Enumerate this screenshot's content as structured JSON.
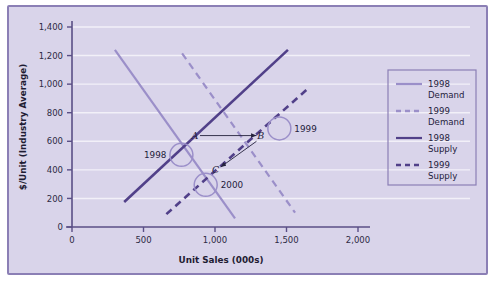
{
  "chart_data": {
    "type": "line",
    "title": "",
    "xlabel": "Unit Sales (000s)",
    "ylabel": "$/Unit (Industry Average)",
    "xlim": [
      0,
      2000
    ],
    "ylim": [
      0,
      1400
    ],
    "xticks": [
      "0",
      "500",
      "1,000",
      "1,500",
      "2,000"
    ],
    "xtick_values": [
      0,
      500,
      1000,
      1500,
      2000
    ],
    "yticks": [
      "0",
      "200",
      "400",
      "600",
      "800",
      "1,000",
      "1,200",
      "1,400"
    ],
    "ytick_values": [
      0,
      200,
      400,
      600,
      800,
      1000,
      1200,
      1400
    ],
    "grid": true,
    "grid_color": "#f2f0f8",
    "legend_position": "right",
    "series": [
      {
        "name": "1998 Demand",
        "style": "solid",
        "color": "#9b8fc9",
        "width": 2.2,
        "points": [
          [
            300,
            1240
          ],
          [
            1140,
            60
          ]
        ]
      },
      {
        "name": "1999 Demand",
        "style": "dashed",
        "color": "#9b8fc9",
        "width": 2.2,
        "points": [
          [
            770,
            1215
          ],
          [
            1560,
            100
          ]
        ]
      },
      {
        "name": "1998 Supply",
        "style": "solid",
        "color": "#514089",
        "width": 2.6,
        "points": [
          [
            365,
            175
          ],
          [
            1510,
            1240
          ]
        ]
      },
      {
        "name": "1999 Supply",
        "style": "dashed",
        "color": "#514089",
        "width": 2.6,
        "points": [
          [
            660,
            90
          ],
          [
            1640,
            960
          ]
        ]
      }
    ],
    "markers": [
      {
        "label": "1998",
        "x": 765,
        "y": 505,
        "label_side": "left"
      },
      {
        "label": "1999",
        "x": 1450,
        "y": 690,
        "label_side": "right"
      },
      {
        "label": "2000",
        "x": 935,
        "y": 295,
        "label_side": "right"
      }
    ],
    "annotations": [
      {
        "label": "A",
        "x": 860,
        "y": 640
      },
      {
        "label": "B",
        "x": 1320,
        "y": 640
      },
      {
        "label": "C",
        "x": 1005,
        "y": 400
      }
    ],
    "arrows": [
      {
        "from": [
          895,
          640
        ],
        "to": [
          1290,
          640
        ],
        "name": "a-to-b-arrow"
      },
      {
        "from": [
          1290,
          600
        ],
        "to": [
          1040,
          420
        ],
        "name": "b-to-c-arrow"
      }
    ]
  },
  "legend": {
    "items": [
      {
        "label_line1": "1998",
        "label_line2": "Demand",
        "style": "solid",
        "color": "#9b8fc9"
      },
      {
        "label_line1": "1999",
        "label_line2": "Demand",
        "style": "dashed",
        "color": "#9b8fc9"
      },
      {
        "label_line1": "1998",
        "label_line2": "Supply",
        "style": "solid",
        "color": "#514089"
      },
      {
        "label_line1": "1999",
        "label_line2": "Supply",
        "style": "dashed",
        "color": "#514089"
      }
    ]
  },
  "colors": {
    "panel_background": "#d9d4ea",
    "frame_border": "#8b7fb5",
    "axis": "#5a4f86",
    "grid": "#f2f0f8",
    "demand": "#9b8fc9",
    "supply": "#514089",
    "text": "#24213c"
  }
}
